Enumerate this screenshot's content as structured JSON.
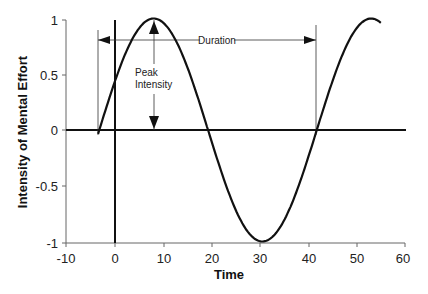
{
  "chart_data": {
    "type": "line",
    "title": "",
    "xlabel": "Time",
    "ylabel": "Intensity of Mental Effort",
    "xlim": [
      -10,
      60
    ],
    "ylim": [
      -1,
      1
    ],
    "xticks": [
      -10,
      0,
      10,
      20,
      30,
      40,
      50,
      60
    ],
    "yticks": [
      1,
      0.5,
      0,
      -0.5,
      -1
    ],
    "ytick_labels": [
      "1",
      "0.5",
      "0",
      "-0.5",
      "-1"
    ],
    "grid": false,
    "legend": null,
    "series": [
      {
        "name": "Mental effort (sinusoid)",
        "description": "Sine wave, period ~45, peak 1 at t~8, min -1 at t~30",
        "x": [
          -3.5,
          0,
          2,
          4,
          6,
          8,
          10,
          12,
          14,
          16,
          19,
          22,
          25,
          28,
          30,
          32,
          35,
          38,
          41.5,
          44,
          47,
          50,
          53,
          55
        ],
        "y": [
          -0.05,
          0.44,
          0.66,
          0.84,
          0.96,
          1.0,
          0.97,
          0.87,
          0.71,
          0.5,
          0.0,
          -0.4,
          -0.78,
          -0.98,
          -1.0,
          -0.96,
          -0.79,
          -0.47,
          0.0,
          0.34,
          0.7,
          0.94,
          1.0,
          0.95
        ]
      }
    ],
    "annotations": [
      {
        "text": "Duration",
        "type": "double-arrow",
        "x_from": -3.8,
        "x_to": 41.7,
        "y": 0.83
      },
      {
        "text": "Peak Intensity",
        "type": "double-arrow",
        "x": 8,
        "y_from": 0,
        "y_to": 1
      },
      {
        "type": "vertical-line",
        "x": 0,
        "note": "bold line at time 0"
      },
      {
        "type": "horizontal-line",
        "y": 0,
        "note": "bold baseline at intensity 0"
      }
    ]
  },
  "labels": {
    "duration": "Duration",
    "peak_line1": "Peak",
    "peak_line2": "Intensity",
    "xlabel": "Time",
    "ylabel": "Intensity of Mental Effort"
  },
  "ticks": {
    "x": [
      "-10",
      "0",
      "10",
      "20",
      "30",
      "40",
      "50",
      "60"
    ],
    "y": [
      "1",
      "0.5",
      "0",
      "-0.5",
      "-1"
    ]
  },
  "colors": {
    "line": "#111111",
    "axis": "#555555",
    "text": "#222222"
  }
}
